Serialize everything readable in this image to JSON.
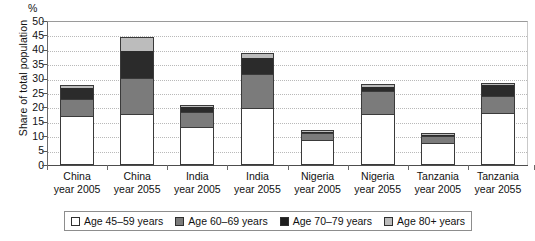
{
  "chart_data": {
    "type": "bar",
    "stacked": true,
    "title": "",
    "unit_label": "%",
    "ylabel": "Share of total population",
    "xlabel": "",
    "ylim": [
      0,
      50
    ],
    "yticks": [
      0,
      5,
      10,
      15,
      20,
      25,
      30,
      35,
      40,
      45,
      50
    ],
    "grid": true,
    "legend_position": "bottom",
    "categories": [
      {
        "line1": "China",
        "line2": "year 2005"
      },
      {
        "line1": "China",
        "line2": "year 2055"
      },
      {
        "line1": "India",
        "line2": "year 2005"
      },
      {
        "line1": "India",
        "line2": "year 2055"
      },
      {
        "line1": "Nigeria",
        "line2": "year 2005"
      },
      {
        "line1": "Nigeria",
        "line2": "year 2055"
      },
      {
        "line1": "Tanzania",
        "line2": "year 2005"
      },
      {
        "line1": "Tanzania",
        "line2": "year 2055"
      }
    ],
    "series": [
      {
        "name": "Age 45–59 years",
        "color": "#ffffff",
        "values": [
          17.0,
          17.5,
          13.0,
          19.5,
          8.5,
          17.5,
          7.5,
          18.0
        ]
      },
      {
        "name": "Age 60–69 years",
        "color": "#7b7b7b",
        "values": [
          6.0,
          12.5,
          5.5,
          12.0,
          2.5,
          8.0,
          2.5,
          6.0
        ]
      },
      {
        "name": "Age 70–79 years",
        "color": "#2b2b2b",
        "values": [
          4.0,
          10.0,
          2.0,
          6.0,
          0.8,
          2.0,
          0.7,
          4.0
        ]
      },
      {
        "name": "Age 80+ years",
        "color": "#bcbcbc",
        "values": [
          0.8,
          4.5,
          0.5,
          1.5,
          0.2,
          0.5,
          0.3,
          0.5
        ]
      }
    ],
    "totals": [
      27.8,
      44.5,
      21.0,
      39.0,
      12.0,
      28.0,
      11.0,
      28.5
    ]
  },
  "legend": {
    "items": [
      {
        "label": "Age 45–59 years",
        "swatch": "white-swatch"
      },
      {
        "label": "Age 60–69 years",
        "swatch": "gray-swatch"
      },
      {
        "label": "Age 70–79 years",
        "swatch": "black-swatch"
      },
      {
        "label": "Age 80+ years",
        "swatch": "lightgray-swatch"
      }
    ]
  }
}
